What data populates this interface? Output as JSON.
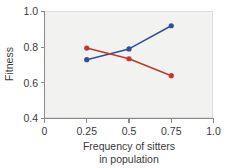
{
  "chart_data": {
    "type": "line",
    "title": "",
    "xlabel": "Frequency of sitters in population",
    "xlabel_line1": "Frequency of sitters",
    "xlabel_line2": "in population",
    "ylabel": "Fitness",
    "xlim": [
      0,
      1.0
    ],
    "ylim": [
      0.4,
      1.0
    ],
    "xticks": [
      0,
      0.25,
      0.5,
      0.75,
      1.0
    ],
    "xticklabels": [
      "0",
      "0.25",
      "0.5",
      "0.75",
      "1.0"
    ],
    "yticks": [
      0.4,
      0.6,
      0.8,
      1.0
    ],
    "yticklabels": [
      "0.4",
      "0.6",
      "0.8",
      "1.0"
    ],
    "grid": false,
    "legend": "none",
    "x": [
      0.25,
      0.5,
      0.75
    ],
    "series": [
      {
        "name": "rovers",
        "color": "#2d4f9e",
        "values": [
          0.73,
          0.79,
          0.92
        ]
      },
      {
        "name": "sitters",
        "color": "#c0392b",
        "values": [
          0.795,
          0.735,
          0.64
        ]
      }
    ],
    "plot_background": "#f2f2f0",
    "axis_color": "#8a8a8a",
    "text_color": "#3a3a3a"
  }
}
